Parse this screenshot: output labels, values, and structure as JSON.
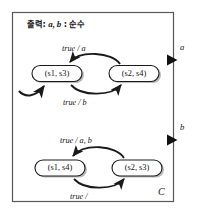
{
  "diagram": {
    "component_label": "C",
    "header": {
      "prefix": "출력",
      "colon": ":",
      "signals": "a, b",
      "separator": ":",
      "type": "순수",
      "full_text": "출력: a, b : 순수"
    },
    "colors": {
      "border": "#58585a",
      "stroke": "#1a1a1a",
      "background": "#ffffff",
      "shadow": "#b9b9bb",
      "text": "#1a1a1a"
    },
    "outer_box": {
      "name": "component-boundary",
      "x": 12,
      "y": 12,
      "width": 162,
      "height": 190
    },
    "ports": [
      {
        "id": "port-a",
        "label": "a",
        "direction": "output",
        "x": 174,
        "y": 60
      },
      {
        "id": "port-b",
        "label": "b",
        "direction": "output",
        "x": 174,
        "y": 140
      }
    ],
    "machines": [
      {
        "id": "machine-upper",
        "has_initial_arrow": true,
        "states": [
          {
            "id": "state-s1-s3",
            "label": "(s1, s3)",
            "cx": 57,
            "cy": 74,
            "w": 50,
            "h": 16
          },
          {
            "id": "state-s2-s4",
            "label": "(s2, s4)",
            "cx": 134,
            "cy": 74,
            "w": 50,
            "h": 16
          }
        ],
        "transitions": [
          {
            "id": "transition-upper-top",
            "guard": "true",
            "slash": "/",
            "output": "a",
            "label": "true / a",
            "from": "state-s2-s4",
            "to": "state-s1-s3",
            "label_x": 79,
            "label_y": 48
          },
          {
            "id": "transition-upper-bottom",
            "guard": "true",
            "slash": "/",
            "output": "b",
            "label": "true / b",
            "from": "state-s1-s3",
            "to": "state-s2-s4",
            "label_x": 79,
            "label_y": 97
          }
        ]
      },
      {
        "id": "machine-lower",
        "has_initial_arrow": false,
        "states": [
          {
            "id": "state-s1-s4",
            "label": "(s1, s4)",
            "cx": 60,
            "cy": 168,
            "w": 50,
            "h": 16
          },
          {
            "id": "state-s2-s3",
            "label": "(s2, s3)",
            "cx": 137,
            "cy": 168,
            "w": 50,
            "h": 16
          }
        ],
        "transitions": [
          {
            "id": "transition-lower-top",
            "guard": "true",
            "slash": "/",
            "output": "a, b",
            "label": "true / a, b",
            "from": "state-s2-s3",
            "to": "state-s1-s4",
            "label_x": 76,
            "label_y": 140
          },
          {
            "id": "transition-lower-bottom",
            "guard": "true",
            "slash": "/",
            "output": "",
            "label": "true /",
            "from": "state-s1-s4",
            "to": "state-s2-s3",
            "label_x": 85,
            "label_y": 191
          }
        ]
      }
    ]
  }
}
